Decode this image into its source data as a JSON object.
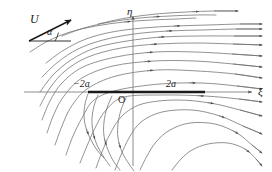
{
  "figure": {
    "background_color": "#ffffff",
    "stream_color": "#6e6e6e",
    "axis_color": "#777777",
    "plate_color": "#1a1a1a",
    "label_color": "#1a1a1a",
    "width": 272,
    "height": 172
  },
  "axes": {
    "horizontal_label": "ξ",
    "vertical_label": "η",
    "origin_label": "O",
    "origin_x": 133,
    "origin_y": 92
  },
  "plate": {
    "left_label": "−2a",
    "right_label": "2a",
    "left_x": 88,
    "right_x": 205,
    "y": 92,
    "thickness": 2.4,
    "total_length_label": "4a"
  },
  "freestream": {
    "speed_label": "U",
    "angle_label": "α",
    "arrow_tail_x": 29,
    "arrow_tail_y": 41,
    "arrow_tip_x": 71,
    "arrow_tip_y": 20,
    "baseline_end_x": 71,
    "baseline_end_y": 41
  },
  "chart_data": {
    "type": "line",
    "xlabel": "ξ",
    "ylabel": "η",
    "grid": false,
    "legend": null,
    "annotations": [
      {
        "text": "U",
        "role": "freestream-speed"
      },
      {
        "text": "α",
        "role": "angle-of-attack"
      },
      {
        "text": "−2a",
        "role": "plate-left-endpoint"
      },
      {
        "text": "2a",
        "role": "plate-right-endpoint"
      },
      {
        "text": "O",
        "role": "origin"
      },
      {
        "text": "ξ",
        "role": "x-axis"
      },
      {
        "text": "η",
        "role": "y-axis"
      }
    ],
    "series": [
      {
        "name": "streamline-01",
        "arrow_at": 0.62,
        "points": [
          [
            46,
            63
          ],
          [
            64,
            50
          ],
          [
            86,
            39
          ],
          [
            112,
            32
          ],
          [
            143,
            28
          ],
          [
            176,
            26
          ],
          [
            208,
            25
          ],
          [
            240,
            24
          ],
          [
            262,
            24
          ]
        ]
      },
      {
        "name": "streamline-02",
        "arrow_at": 0.6,
        "points": [
          [
            42,
            77
          ],
          [
            58,
            62
          ],
          [
            78,
            49
          ],
          [
            103,
            40
          ],
          [
            134,
            34
          ],
          [
            168,
            31
          ],
          [
            202,
            30
          ],
          [
            236,
            29
          ],
          [
            262,
            29
          ]
        ]
      },
      {
        "name": "streamline-03",
        "arrow_at": 0.58,
        "points": [
          [
            40,
            92
          ],
          [
            53,
            75
          ],
          [
            71,
            60
          ],
          [
            95,
            48
          ],
          [
            127,
            41
          ],
          [
            162,
            37
          ],
          [
            198,
            36
          ],
          [
            234,
            36
          ],
          [
            262,
            36
          ]
        ]
      },
      {
        "name": "streamline-04",
        "arrow_at": 0.56,
        "points": [
          [
            40,
            106
          ],
          [
            50,
            88
          ],
          [
            65,
            71
          ],
          [
            88,
            57
          ],
          [
            121,
            48
          ],
          [
            158,
            44
          ],
          [
            196,
            43
          ],
          [
            233,
            44
          ],
          [
            262,
            45
          ]
        ]
      },
      {
        "name": "streamline-05",
        "arrow_at": 0.55,
        "points": [
          [
            42,
            120
          ],
          [
            50,
            101
          ],
          [
            62,
            83
          ],
          [
            83,
            67
          ],
          [
            116,
            57
          ],
          [
            155,
            52
          ],
          [
            195,
            52
          ],
          [
            232,
            54
          ],
          [
            262,
            56
          ]
        ]
      },
      {
        "name": "streamline-06",
        "arrow_at": 0.54,
        "points": [
          [
            47,
            133
          ],
          [
            54,
            114
          ],
          [
            64,
            96
          ],
          [
            82,
            78
          ],
          [
            113,
            66
          ],
          [
            154,
            61
          ],
          [
            195,
            61
          ],
          [
            233,
            64
          ],
          [
            262,
            67
          ]
        ]
      },
      {
        "name": "streamline-07",
        "arrow_at": 0.54,
        "points": [
          [
            55,
            145
          ],
          [
            62,
            126
          ],
          [
            71,
            107
          ],
          [
            87,
            89
          ],
          [
            116,
            76
          ],
          [
            157,
            70
          ],
          [
            198,
            71
          ],
          [
            235,
            74
          ],
          [
            262,
            78
          ]
        ]
      },
      {
        "name": "streamline-08",
        "arrow_at": 0.7,
        "points": [
          [
            66,
            155
          ],
          [
            73,
            136
          ],
          [
            82,
            118
          ],
          [
            94,
            100
          ],
          [
            118,
            90
          ],
          [
            160,
            84
          ],
          [
            201,
            83
          ],
          [
            237,
            86
          ],
          [
            262,
            89
          ]
        ]
      },
      {
        "name": "streamline-09",
        "arrow_at": 0.72,
        "points": [
          [
            80,
            163
          ],
          [
            87,
            146
          ],
          [
            95,
            128
          ],
          [
            106,
            110
          ],
          [
            124,
            97
          ],
          [
            164,
            95
          ],
          [
            205,
            96
          ],
          [
            239,
            99
          ],
          [
            262,
            102
          ]
        ]
      },
      {
        "name": "streamline-10",
        "arrow_at": 0.74,
        "points": [
          [
            96,
            168
          ],
          [
            102,
            152
          ],
          [
            110,
            134
          ],
          [
            122,
            116
          ],
          [
            142,
            104
          ],
          [
            176,
            100
          ],
          [
            210,
            103
          ],
          [
            240,
            110
          ],
          [
            262,
            116
          ]
        ]
      },
      {
        "name": "streamline-11",
        "arrow_at": 0.76,
        "points": [
          [
            115,
            170
          ],
          [
            121,
            155
          ],
          [
            129,
            138
          ],
          [
            141,
            122
          ],
          [
            162,
            112
          ],
          [
            192,
            110
          ],
          [
            220,
            116
          ],
          [
            243,
            126
          ],
          [
            262,
            134
          ]
        ]
      },
      {
        "name": "streamline-12",
        "arrow_at": 0.78,
        "points": [
          [
            140,
            170
          ],
          [
            147,
            156
          ],
          [
            156,
            142
          ],
          [
            170,
            130
          ],
          [
            190,
            123
          ],
          [
            215,
            124
          ],
          [
            237,
            133
          ],
          [
            252,
            145
          ],
          [
            262,
            153
          ]
        ]
      },
      {
        "name": "streamline-13",
        "arrow_at": 0.8,
        "points": [
          [
            172,
            170
          ],
          [
            181,
            159
          ],
          [
            192,
            150
          ],
          [
            208,
            144
          ],
          [
            228,
            143
          ],
          [
            245,
            149
          ],
          [
            256,
            159
          ],
          [
            262,
            166
          ]
        ]
      },
      {
        "name": "streamline-14",
        "arrow_at": 0.6,
        "points": [
          [
            30,
            52
          ],
          [
            48,
            41
          ],
          [
            70,
            32
          ],
          [
            96,
            26
          ],
          [
            124,
            22
          ],
          [
            152,
            20
          ],
          [
            176,
            19
          ],
          [
            196,
            18
          ]
        ]
      },
      {
        "name": "streamline-15",
        "arrow_at": 0.62,
        "points": [
          [
            62,
            36
          ],
          [
            84,
            28
          ],
          [
            110,
            22
          ],
          [
            140,
            18
          ],
          [
            170,
            16
          ],
          [
            196,
            15
          ],
          [
            216,
            15
          ]
        ]
      },
      {
        "name": "streamline-16",
        "arrow_at": 0.7,
        "points": [
          [
            98,
            24
          ],
          [
            126,
            18
          ],
          [
            156,
            14
          ],
          [
            186,
            12
          ],
          [
            214,
            11
          ],
          [
            238,
            11
          ]
        ]
      },
      {
        "name": "streamline-17-lower-recirc",
        "arrow_at": 0.55,
        "points": [
          [
            88,
            94
          ],
          [
            85,
            104
          ],
          [
            84,
            116
          ],
          [
            86,
            128
          ],
          [
            91,
            140
          ],
          [
            97,
            150
          ],
          [
            104,
            158
          ]
        ]
      },
      {
        "name": "streamline-18-lower-recirc",
        "arrow_at": 0.55,
        "points": [
          [
            98,
            95
          ],
          [
            94,
            106
          ],
          [
            92,
            118
          ],
          [
            93,
            132
          ],
          [
            97,
            145
          ],
          [
            103,
            156
          ],
          [
            110,
            166
          ]
        ]
      },
      {
        "name": "streamline-19-lower-recirc",
        "arrow_at": 0.6,
        "points": [
          [
            112,
            96
          ],
          [
            107,
            108
          ],
          [
            104,
            122
          ],
          [
            104,
            136
          ],
          [
            108,
            150
          ],
          [
            114,
            162
          ],
          [
            120,
            170
          ]
        ]
      },
      {
        "name": "streamline-20-lower-recirc",
        "arrow_at": 0.62,
        "points": [
          [
            126,
            98
          ],
          [
            121,
            110
          ],
          [
            118,
            124
          ],
          [
            118,
            138
          ],
          [
            122,
            152
          ],
          [
            129,
            164
          ],
          [
            134,
            171
          ]
        ]
      }
    ],
    "xlim": [
      0,
      272
    ],
    "ylim": [
      0,
      172
    ]
  }
}
